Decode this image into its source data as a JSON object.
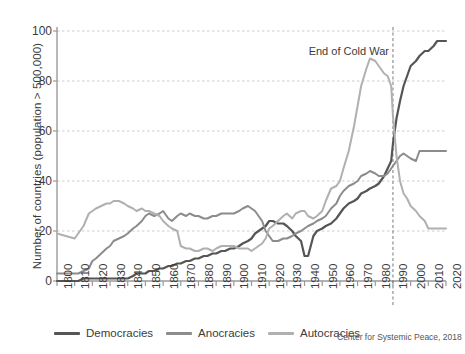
{
  "chart_data": {
    "type": "line",
    "title": "",
    "xlabel": "",
    "ylabel": "Number of countries (population > 500,000)",
    "xlim": [
      1800,
      2020
    ],
    "ylim": [
      0,
      100
    ],
    "grid": true,
    "legend_position": "bottom",
    "source": "Center for Systemic Peace, 2018",
    "xticks": [
      1800,
      1810,
      1820,
      1830,
      1840,
      1850,
      1860,
      1870,
      1880,
      1890,
      1900,
      1910,
      1920,
      1930,
      1940,
      1950,
      1960,
      1970,
      1980,
      1990,
      2000,
      2010,
      2020
    ],
    "yticks": [
      0,
      20,
      40,
      60,
      80,
      100
    ],
    "annotations": [
      {
        "text": "End of Cold War",
        "x": 1990,
        "y": 92,
        "line": "dashed-vertical"
      }
    ],
    "colors": {
      "democracies": "#555555",
      "anocracies": "#8c8c8c",
      "autocracies": "#b0b0b0",
      "grid": "#cccccc",
      "axis": "#9a9a9a",
      "text": "#3b3b3b"
    },
    "x": [
      1800,
      1805,
      1810,
      1812,
      1815,
      1818,
      1820,
      1822,
      1825,
      1828,
      1830,
      1832,
      1835,
      1838,
      1840,
      1843,
      1845,
      1848,
      1850,
      1852,
      1855,
      1858,
      1860,
      1863,
      1865,
      1868,
      1870,
      1873,
      1875,
      1878,
      1880,
      1883,
      1885,
      1888,
      1890,
      1893,
      1895,
      1898,
      1900,
      1903,
      1905,
      1908,
      1910,
      1912,
      1914,
      1916,
      1918,
      1920,
      1922,
      1925,
      1928,
      1930,
      1933,
      1935,
      1938,
      1940,
      1942,
      1945,
      1947,
      1950,
      1952,
      1955,
      1958,
      1960,
      1962,
      1965,
      1968,
      1970,
      1972,
      1975,
      1977,
      1980,
      1982,
      1985,
      1987,
      1989,
      1990,
      1992,
      1994,
      1996,
      1998,
      2000,
      2003,
      2005,
      2008,
      2010,
      2013,
      2015,
      2018,
      2020
    ],
    "series": [
      {
        "name": "Democracies",
        "color": "#555555",
        "values": [
          0,
          0,
          0,
          0,
          1,
          1,
          1,
          1,
          1,
          1,
          1,
          1,
          1,
          1,
          1,
          2,
          3,
          3,
          3,
          4,
          4,
          5,
          5,
          6,
          6,
          7,
          7,
          8,
          8,
          9,
          9,
          10,
          10,
          11,
          11,
          12,
          12,
          13,
          13,
          14,
          15,
          16,
          17,
          19,
          20,
          21,
          22,
          24,
          24,
          23,
          23,
          22,
          20,
          18,
          16,
          10,
          10,
          18,
          20,
          21,
          22,
          23,
          25,
          27,
          29,
          31,
          32,
          33,
          35,
          36,
          37,
          38,
          39,
          42,
          45,
          48,
          55,
          65,
          72,
          78,
          82,
          86,
          88,
          90,
          92,
          92,
          94,
          96,
          96,
          96
        ]
      },
      {
        "name": "Anocracies",
        "color": "#8c8c8c",
        "values": [
          3,
          3,
          3,
          3,
          4,
          5,
          8,
          9,
          11,
          13,
          14,
          16,
          17,
          18,
          19,
          21,
          22,
          24,
          26,
          27,
          26,
          27,
          28,
          25,
          24,
          26,
          27,
          26,
          27,
          26,
          26,
          25,
          25,
          26,
          26,
          27,
          27,
          27,
          27,
          28,
          29,
          30,
          29,
          28,
          26,
          24,
          20,
          18,
          16,
          16,
          17,
          17,
          18,
          19,
          20,
          21,
          22,
          23,
          24,
          25,
          26,
          29,
          31,
          34,
          36,
          38,
          39,
          40,
          42,
          43,
          44,
          43,
          42,
          42,
          43,
          45,
          46,
          48,
          50,
          51,
          50,
          49,
          48,
          52,
          52,
          52,
          52,
          52,
          52,
          52
        ]
      },
      {
        "name": "Autocracies",
        "color": "#b0b0b0",
        "values": [
          19,
          18,
          17,
          19,
          22,
          27,
          28,
          29,
          30,
          31,
          31,
          32,
          32,
          31,
          30,
          29,
          28,
          29,
          28,
          28,
          27,
          26,
          24,
          22,
          21,
          20,
          14,
          13,
          13,
          12,
          12,
          13,
          13,
          12,
          13,
          14,
          14,
          14,
          14,
          13,
          13,
          13,
          12,
          13,
          14,
          15,
          17,
          21,
          22,
          24,
          26,
          27,
          25,
          27,
          28,
          28,
          26,
          25,
          26,
          28,
          32,
          37,
          38,
          40,
          45,
          52,
          62,
          70,
          78,
          85,
          89,
          88,
          86,
          83,
          82,
          78,
          66,
          50,
          40,
          35,
          33,
          30,
          28,
          26,
          24,
          21,
          21,
          21,
          21,
          21
        ]
      }
    ]
  },
  "axis": {
    "ylabel": "Number of countries (population > 500,000)",
    "yticks": [
      "0",
      "20",
      "40",
      "60",
      "80",
      "100"
    ],
    "xticks": [
      "1800",
      "1810",
      "1820",
      "1830",
      "1840",
      "1850",
      "1860",
      "1870",
      "1880",
      "1890",
      "1900",
      "1910",
      "1920",
      "1930",
      "1940",
      "1950",
      "1960",
      "1970",
      "1980",
      "1990",
      "2000",
      "2010",
      "2020"
    ]
  },
  "annotation": {
    "cold_war": "End of Cold War"
  },
  "legend": {
    "items": [
      {
        "label": "Democracies",
        "color": "#555555"
      },
      {
        "label": "Anocracies",
        "color": "#8c8c8c"
      },
      {
        "label": "Autocracies",
        "color": "#b0b0b0"
      }
    ]
  },
  "credit": {
    "text": "Center for Systemic Peace, 2018"
  }
}
